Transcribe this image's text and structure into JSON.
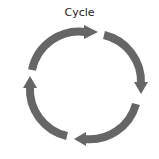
{
  "title": "Cycle",
  "arrow_color": "#666666",
  "segments": [
    "arrow-1",
    "arrow-2",
    "arrow-3",
    "arrow-4"
  ],
  "direction": "clockwise"
}
